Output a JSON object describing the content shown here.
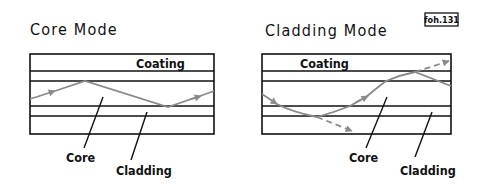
{
  "figure_ref": "foh.131",
  "colors": {
    "ink": "#111111",
    "ray": "#8a8a8a",
    "background": "#ffffff"
  },
  "panels": [
    {
      "title": "Core Mode",
      "layers": {
        "coating": "Coating",
        "core": "Core",
        "cladding": "Cladding"
      },
      "ray": {
        "description": "ray reflected within the core between core/cladding boundaries",
        "escapes": false
      }
    },
    {
      "title": "Cladding Mode",
      "layers": {
        "coating": "Coating",
        "core": "Core",
        "cladding": "Cladding"
      },
      "ray": {
        "description": "ray traversing core and cladding, partly refracted into coating and outer cladding",
        "escapes": true
      }
    }
  ]
}
